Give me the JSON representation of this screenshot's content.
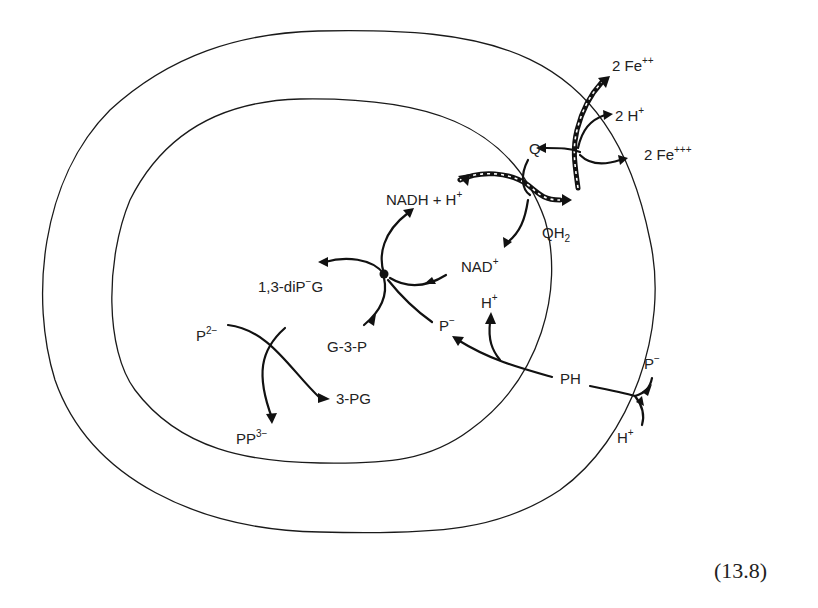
{
  "figure": {
    "equation_number": "(13.8)",
    "labels": {
      "fe2": {
        "base": "2 Fe",
        "sup": "++"
      },
      "h2_out": {
        "base": "2 H",
        "sup": "+"
      },
      "fe3": {
        "base": "2 Fe",
        "sup": "+++"
      },
      "q": {
        "base": "Q"
      },
      "qh2": {
        "base": "QH",
        "sub": "2"
      },
      "nadh": {
        "base": "NADH + H",
        "sup": "+"
      },
      "nad": {
        "base": "NAD",
        "sup": "+"
      },
      "diPG": {
        "base": "1,3-diP",
        "sup": "−",
        "tail": "G"
      },
      "g3p": {
        "base": "G-3-P"
      },
      "p_minus_inner": {
        "base": "P",
        "sup": "−"
      },
      "h_inner": {
        "base": "H",
        "sup": "+"
      },
      "p2": {
        "base": "P",
        "sup": "2−"
      },
      "pg3": {
        "base": "3-PG"
      },
      "pp3": {
        "base": "PP",
        "sup": "3−"
      },
      "ph": {
        "base": "PH"
      },
      "p_minus_outer": {
        "base": "P",
        "sup": "−"
      },
      "h_outer": {
        "base": "H",
        "sup": "+"
      }
    }
  }
}
